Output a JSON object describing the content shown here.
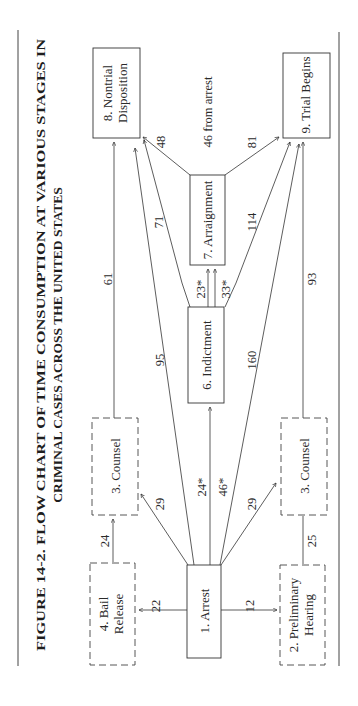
{
  "figure": {
    "title_line1": "FIGURE 14-2. FLOW CHART OF TIME CONSUMPTION AT VARIOUS STAGES IN",
    "title_line2": "CRIMINAL CASES ACROSS THE UNITED STATES"
  },
  "nodes": {
    "arrest": "1.  Arrest",
    "prelim_1": "2.  Preliminary",
    "prelim_2": "Hearing",
    "counsel_top": "3.  Counsel",
    "counsel_bottom": "3.  Counsel",
    "bail_1": "4.  Bail",
    "bail_2": "Release",
    "indictment": "6.  Indictment",
    "arraignment": "7.  Arraignment",
    "nontrial_1": "8.  Nontrial",
    "nontrial_2": "Disposition",
    "trial": "9.  Trial Begins"
  },
  "edges": {
    "arrest_bail": "22",
    "arrest_prelim": "12",
    "bail_counsel": "24",
    "prelim_counsel": "25",
    "arrest_counsel_top": "29",
    "arrest_counsel_bottom": "29",
    "arrest_indictment_a": "24*",
    "arrest_indictment_b": "46*",
    "arrest_nontrial": "95",
    "arrest_trial": "160",
    "counsel_nontrial": "61",
    "counsel_trial": "93",
    "indictment_arraignment_a": "23*",
    "indictment_arraignment_b": "33*",
    "indictment_nontrial": "71",
    "indictment_trial": "114",
    "arraignment_nontrial": "48",
    "arraignment_trial": "81",
    "arraignment_from_arrest": "46 from arrest"
  }
}
